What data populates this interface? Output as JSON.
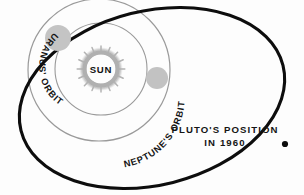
{
  "figure": {
    "background_color": "#fdfdfd",
    "annotation": {
      "line1": "PLUTO'S  POSITION",
      "line2": "IN  1960",
      "color": "#151515"
    },
    "sun": {
      "label": "SUN",
      "corona_color": "#b7b7b7",
      "center_x": 101,
      "center_y": 69,
      "core_radius": 15,
      "corona_radius": 23
    },
    "orbits": [
      {
        "name": "uranus-orbit",
        "label": "URANUS' ORBIT",
        "type": "circle",
        "stroke": "#9a9a9a",
        "stroke_width": 1.1,
        "center_x": 101,
        "center_y": 69,
        "radius": 46
      },
      {
        "name": "neptune-orbit",
        "label": "NEPTUNE'S ORBIT",
        "type": "circle",
        "stroke": "#9a9a9a",
        "stroke_width": 1.2,
        "center_x": 99,
        "center_y": 70,
        "radius": 71
      },
      {
        "name": "pluto-orbit",
        "label": "",
        "type": "ellipse",
        "stroke": "#0d0d0d",
        "stroke_width": 3.1,
        "center_x": 152,
        "center_y": 98,
        "radius_x": 135,
        "radius_y": 87,
        "rotation_deg": -14
      }
    ],
    "planets": [
      {
        "name": "uranus-marker",
        "color": "#c4c4c4",
        "cx": 58,
        "cy": 38,
        "r": 13
      },
      {
        "name": "neptune-marker",
        "color": "#c2c2c2",
        "cx": 157,
        "cy": 78,
        "r": 11
      },
      {
        "name": "pluto-marker",
        "color": "#0d0d0d",
        "cx": 285,
        "cy": 144,
        "r": 3.1
      }
    ]
  }
}
